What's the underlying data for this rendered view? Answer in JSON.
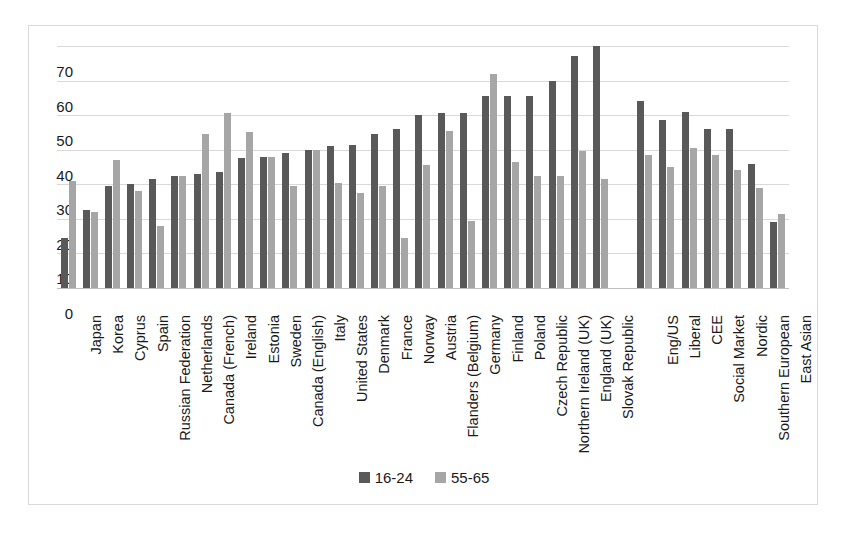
{
  "chart_data": {
    "type": "bar",
    "title": "",
    "xlabel": "",
    "ylabel": "",
    "ylim": [
      0,
      70
    ],
    "yticks": [
      0,
      10,
      20,
      30,
      40,
      50,
      60,
      70
    ],
    "grid": true,
    "legend_position": "bottom",
    "categories": [
      "Japan",
      "Korea",
      "Cyprus",
      "Spain",
      "Russian Federation",
      "Netherlands",
      "Canada (French)",
      "Ireland",
      "Estonia",
      "Sweden",
      "Canada (English)",
      "Italy",
      "United States",
      "Denmark",
      "France",
      "Norway",
      "Austria",
      "Flanders (Belgium)",
      "Germany",
      "Finland",
      "Poland",
      "Czech Republic",
      "Northern Ireland (UK)",
      "England (UK)",
      "Slovak Republic",
      "",
      "Eng/US",
      "Liberal",
      "CEE",
      "Social Market",
      "Nordic",
      "Southern European",
      "East Asian"
    ],
    "series": [
      {
        "name": "16-24",
        "color": "#595959",
        "values": [
          14.5,
          22.5,
          29.5,
          30,
          31.5,
          32.5,
          33,
          33.5,
          37.5,
          38,
          39,
          40,
          41,
          41.5,
          44.5,
          46,
          50,
          50.5,
          50.5,
          55.5,
          55.5,
          55.5,
          60,
          67,
          70,
          null,
          54,
          48.5,
          51,
          46,
          46,
          36,
          19
        ]
      },
      {
        "name": "55-65",
        "color": "#a6a6a6",
        "values": [
          31,
          22,
          37,
          28,
          18,
          32.5,
          44.5,
          50.5,
          45,
          38,
          29.5,
          40,
          30.5,
          27.5,
          29.5,
          14.5,
          35.5,
          45.5,
          19.5,
          62,
          36.5,
          32.5,
          32.5,
          39.5,
          31.5,
          null,
          38.5,
          35,
          40.5,
          38.5,
          34,
          29,
          21.5
        ]
      }
    ]
  },
  "legend": {
    "items": [
      {
        "label": "16-24",
        "color": "#595959"
      },
      {
        "label": "55-65",
        "color": "#a6a6a6"
      }
    ]
  },
  "colors": {
    "series_16_24": "#595959",
    "series_55_65": "#a6a6a6",
    "gridline": "#d9d9d9",
    "frame_border": "#d9d9d9",
    "text": "#1a1a1a",
    "background": "#ffffff"
  }
}
